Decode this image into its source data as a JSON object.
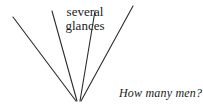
{
  "figure": {
    "background_color": "#ffffff",
    "stroke_color": "#2b2b2b",
    "text_color": "#1a1a1a",
    "width": 203,
    "height": 111,
    "annotation_label": {
      "line1": "several",
      "line2": "glances"
    },
    "caption": "How many men?",
    "rays": [
      {
        "name": "ray-outer-left",
        "x1": 13,
        "y1": 17,
        "x2": 76,
        "y2": 101
      },
      {
        "name": "ray-inner-left",
        "x1": 52,
        "y1": 11,
        "x2": 77,
        "y2": 101
      },
      {
        "name": "ray-inner-right",
        "x1": 95,
        "y1": 11,
        "x2": 80,
        "y2": 101
      },
      {
        "name": "ray-outer-right",
        "x1": 133,
        "y1": 6,
        "x2": 81,
        "y2": 101
      }
    ]
  }
}
